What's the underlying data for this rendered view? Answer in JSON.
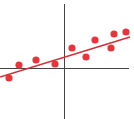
{
  "chart_data": {
    "type": "scatter",
    "title": "",
    "xlabel": "",
    "ylabel": "",
    "grid": false,
    "legend": null,
    "axes": {
      "origin_px": [
        64,
        68
      ],
      "x_axis_px": {
        "from": 0,
        "to": 129
      },
      "y_axis_px": {
        "from": 4,
        "to": 119
      },
      "color": "#444444"
    },
    "xlim": [
      -64,
      65
    ],
    "ylim": [
      -51,
      64
    ],
    "points": [
      {
        "x": -55,
        "y": -10
      },
      {
        "x": -45,
        "y": 3
      },
      {
        "x": -28,
        "y": 8
      },
      {
        "x": -9,
        "y": 4
      },
      {
        "x": 8,
        "y": 20
      },
      {
        "x": 22,
        "y": 11
      },
      {
        "x": 31,
        "y": 28
      },
      {
        "x": 47,
        "y": 20
      },
      {
        "x": 50,
        "y": 34
      },
      {
        "x": 62,
        "y": 36
      }
    ],
    "trend_line": {
      "type": "linear",
      "start": {
        "x": -64,
        "y": -9
      },
      "end": {
        "x": 66,
        "y": 31
      }
    },
    "colors": {
      "points": "#e2383d",
      "trend_line": "#d0303a",
      "axes": "#444444"
    }
  }
}
